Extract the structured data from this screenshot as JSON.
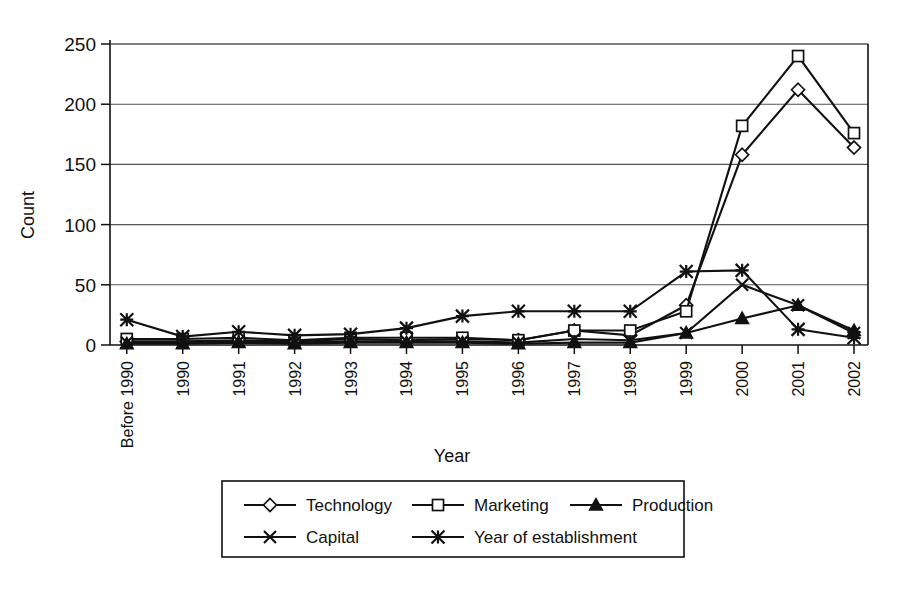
{
  "chart_data": {
    "type": "line",
    "title": "",
    "xlabel": "Year",
    "ylabel": "Count",
    "ylim": [
      0,
      250
    ],
    "ytick_step": 50,
    "yticks": [
      0,
      50,
      100,
      150,
      200,
      250
    ],
    "grid": true,
    "legend_position": "bottom",
    "categories": [
      "Before 1990",
      "1990",
      "1991",
      "1992",
      "1993",
      "1994",
      "1995",
      "1996",
      "1997",
      "1998",
      "1999",
      "2000",
      "2001",
      "2002"
    ],
    "series": [
      {
        "name": "Technology",
        "marker": "diamond-open",
        "values": [
          3,
          3,
          4,
          3,
          5,
          4,
          5,
          4,
          12,
          8,
          33,
          158,
          212,
          164
        ]
      },
      {
        "name": "Marketing",
        "marker": "square-open",
        "values": [
          5,
          5,
          6,
          4,
          6,
          6,
          6,
          4,
          12,
          12,
          28,
          182,
          240,
          176
        ]
      },
      {
        "name": "Production",
        "marker": "triangle-solid",
        "values": [
          1,
          1,
          2,
          1,
          2,
          2,
          2,
          1,
          2,
          2,
          10,
          22,
          33,
          12
        ]
      },
      {
        "name": "Capital",
        "marker": "x-cross",
        "values": [
          2,
          2,
          3,
          2,
          3,
          3,
          3,
          2,
          5,
          4,
          10,
          50,
          33,
          10
        ]
      },
      {
        "name": "Year of establishment",
        "marker": "star-asterisk",
        "values": [
          21,
          7,
          11,
          8,
          9,
          14,
          24,
          28,
          28,
          28,
          61,
          62,
          13,
          6
        ]
      }
    ]
  },
  "legend": {
    "rows": [
      [
        "Technology",
        "Marketing",
        "Production"
      ],
      [
        "Capital",
        "Year of establishment"
      ]
    ]
  },
  "axis": {
    "y_title": "Count",
    "x_title": "Year"
  }
}
